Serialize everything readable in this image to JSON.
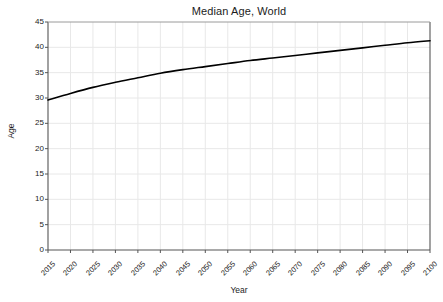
{
  "chart_data": {
    "type": "line",
    "title": "Median Age, World",
    "xlabel": "Year",
    "ylabel": "Age",
    "xlim": [
      2015,
      2100
    ],
    "ylim": [
      0,
      45
    ],
    "grid": true,
    "legend": null,
    "legend_position": "none",
    "line_color": "#000000",
    "grid_color": "#e8e8e8",
    "axis_color": "#555555",
    "background_color": "#ffffff",
    "x_tick_labels": [
      "2015",
      "2020",
      "2025",
      "2030",
      "2035",
      "2040",
      "2045",
      "2050",
      "2055",
      "2060",
      "2065",
      "2070",
      "2075",
      "2080",
      "2085",
      "2090",
      "2095",
      "2100"
    ],
    "y_tick_labels": [
      "0",
      "5",
      "10",
      "15",
      "20",
      "25",
      "30",
      "35",
      "40",
      "45"
    ],
    "x_ticks": [
      2015,
      2020,
      2025,
      2030,
      2035,
      2040,
      2045,
      2050,
      2055,
      2060,
      2065,
      2070,
      2075,
      2080,
      2085,
      2090,
      2095,
      2100
    ],
    "y_ticks": [
      0,
      5,
      10,
      15,
      20,
      25,
      30,
      35,
      40,
      45
    ],
    "series": [
      {
        "name": "Median Age, World",
        "x": [
          2015,
          2020,
          2025,
          2030,
          2035,
          2040,
          2045,
          2050,
          2055,
          2060,
          2065,
          2070,
          2075,
          2080,
          2085,
          2090,
          2095,
          2100
        ],
        "values": [
          29.6,
          30.9,
          32.1,
          33.1,
          34.0,
          34.9,
          35.6,
          36.2,
          36.8,
          37.4,
          37.9,
          38.4,
          38.9,
          39.4,
          39.9,
          40.4,
          40.9,
          41.3
        ]
      }
    ]
  }
}
